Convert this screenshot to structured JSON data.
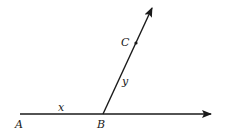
{
  "diagram": {
    "points": {
      "A": {
        "label": "A"
      },
      "B": {
        "label": "B"
      },
      "C": {
        "label": "C"
      }
    },
    "segment_labels": {
      "x": "x",
      "y": "y"
    },
    "colors": {
      "ink": "#1a1a1a",
      "background": "#ffffff"
    }
  }
}
